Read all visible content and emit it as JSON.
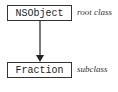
{
  "diagram": {
    "type": "class-hierarchy",
    "nodes": [
      {
        "id": "root",
        "name": "NSObject",
        "annotation": "root class"
      },
      {
        "id": "sub",
        "name": "Fraction",
        "annotation": "subclass"
      }
    ],
    "edges": [
      {
        "from": "root",
        "to": "sub",
        "style": "arrow"
      }
    ]
  }
}
